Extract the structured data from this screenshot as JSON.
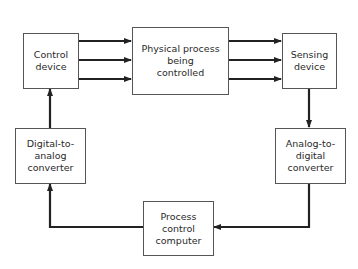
{
  "diagram": {
    "nodes": [
      {
        "id": "control",
        "label": "Control\ndevice"
      },
      {
        "id": "process",
        "label": "Physical process\nbeing\ncontrolled"
      },
      {
        "id": "sensing",
        "label": "Sensing\ndevice"
      },
      {
        "id": "adc",
        "label": "Analog-to-\ndigital\nconverter"
      },
      {
        "id": "computer",
        "label": "Process\ncontrol\ncomputer"
      },
      {
        "id": "dac",
        "label": "Digital-to-\nanalog\nconverter"
      }
    ],
    "edges": [
      {
        "from": "control",
        "to": "process",
        "count": 3
      },
      {
        "from": "process",
        "to": "sensing",
        "count": 3
      },
      {
        "from": "sensing",
        "to": "adc",
        "count": 1
      },
      {
        "from": "adc",
        "to": "computer",
        "count": 1
      },
      {
        "from": "computer",
        "to": "dac",
        "count": 1
      },
      {
        "from": "dac",
        "to": "control",
        "count": 1
      }
    ],
    "colors": {
      "line": "#222222",
      "border": "#555555",
      "background": "#ffffff"
    }
  }
}
